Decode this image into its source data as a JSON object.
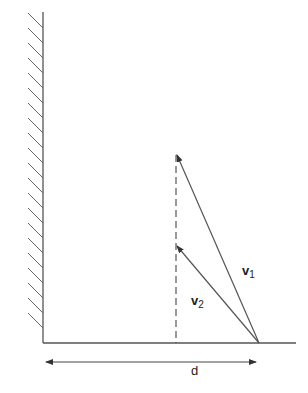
{
  "diagram": {
    "labels": {
      "v1": {
        "symbol": "v",
        "subscript": "1"
      },
      "v2": {
        "symbol": "v",
        "subscript": "2"
      },
      "d": "d"
    },
    "colors": {
      "line": "#444444",
      "background": "#ffffff"
    }
  }
}
